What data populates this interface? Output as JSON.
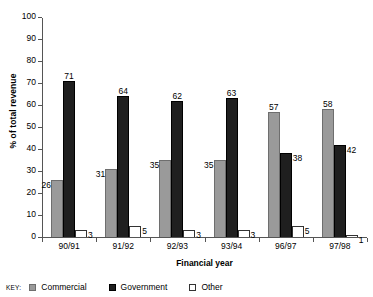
{
  "chart_data": {
    "type": "bar",
    "title": "",
    "xlabel": "Financial year",
    "ylabel": "% of total revenue",
    "ylim": [
      0,
      100
    ],
    "yticks": [
      0,
      10,
      20,
      30,
      40,
      50,
      60,
      70,
      80,
      90,
      100
    ],
    "grid": false,
    "legend_position": "bottom-left",
    "legend_prefix": "KEY:",
    "categories": [
      "90/91",
      "91/92",
      "92/93",
      "93/94",
      "96/97",
      "97/98"
    ],
    "series": [
      {
        "name": "Commercial",
        "color": "#9a9a9a",
        "values": [
          26,
          31,
          35,
          35,
          57,
          58
        ]
      },
      {
        "name": "Government",
        "color": "#1f1f1f",
        "values": [
          71,
          64,
          62,
          63,
          38,
          42
        ]
      },
      {
        "name": "Other",
        "color": "#ffffff",
        "values": [
          3,
          5,
          3,
          3,
          5,
          1
        ]
      }
    ]
  },
  "axis": {
    "y_tick_labels": [
      "100",
      "90",
      "80",
      "70",
      "60",
      "50",
      "40",
      "30",
      "20",
      "10",
      "0"
    ],
    "y_title": "% of total revenue",
    "x_title": "Financial year"
  },
  "legend": {
    "prefix": "KEY:",
    "items": [
      {
        "label": "Commercial"
      },
      {
        "label": "Government"
      },
      {
        "label": "Other"
      }
    ]
  }
}
